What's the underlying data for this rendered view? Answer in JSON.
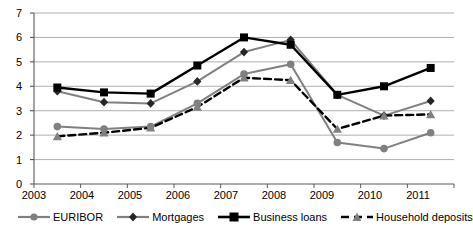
{
  "chart_data": {
    "type": "line",
    "title": "",
    "subtitle": "",
    "xlabel": "",
    "ylabel": "",
    "categories": [
      "2003",
      "2004",
      "2005",
      "2006",
      "2007",
      "2008",
      "2009",
      "2010",
      "2011"
    ],
    "ylim": [
      0,
      7
    ],
    "yticks": [
      "0",
      "1",
      "2",
      "3",
      "4",
      "5",
      "6",
      "7"
    ],
    "grid": "horizontal",
    "legend_position": "bottom",
    "series": [
      {
        "name": "EURIBOR",
        "color": "#808080",
        "marker": "circle",
        "line": "solid",
        "values": [
          2.35,
          2.25,
          2.35,
          3.3,
          4.5,
          4.9,
          1.7,
          1.45,
          2.1
        ]
      },
      {
        "name": "Mortgages",
        "color": "#808080",
        "marker_color": "#262626",
        "marker": "diamond",
        "line": "solid",
        "values": [
          3.8,
          3.35,
          3.3,
          4.2,
          5.4,
          5.9,
          3.65,
          2.8,
          3.4
        ]
      },
      {
        "name": "Business loans",
        "color": "#000000",
        "marker": "square",
        "line": "solid",
        "values": [
          3.95,
          3.75,
          3.7,
          4.85,
          6.0,
          5.7,
          3.65,
          4.0,
          4.75
        ]
      },
      {
        "name": "Household deposits",
        "color": "#000000",
        "marker_color": "#808080",
        "marker": "triangle",
        "line": "dashed",
        "values": [
          1.95,
          2.1,
          2.3,
          3.15,
          4.35,
          4.25,
          2.25,
          2.8,
          2.85
        ]
      }
    ]
  },
  "axis": {
    "y_labels": [
      "7",
      "6",
      "5",
      "4",
      "3",
      "2",
      "1",
      "0"
    ],
    "x_labels": [
      "2003",
      "2004",
      "2005",
      "2006",
      "2007",
      "2008",
      "2009",
      "2010",
      "2011"
    ]
  },
  "legend": {
    "items": [
      {
        "label": "EURIBOR",
        "marker": "circle-marker-icon"
      },
      {
        "label": "Mortgages",
        "marker": "diamond-marker-icon"
      },
      {
        "label": "Business loans",
        "marker": "square-marker-icon"
      },
      {
        "label": "Household deposits",
        "marker": "triangle-marker-icon"
      }
    ]
  }
}
